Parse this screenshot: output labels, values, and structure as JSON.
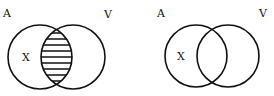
{
  "diagrams": [
    {
      "name": "venn-left",
      "labels": {
        "set_a": "A",
        "set_v": "V",
        "region": "X"
      },
      "shaded_region": "intersection",
      "shading": "horizontal-lines"
    },
    {
      "name": "venn-right",
      "labels": {
        "set_a": "A",
        "set_v": "V",
        "region": "X"
      },
      "shaded_region": "none"
    }
  ],
  "colors": {
    "stroke": "#111111",
    "background": "#ffffff"
  }
}
